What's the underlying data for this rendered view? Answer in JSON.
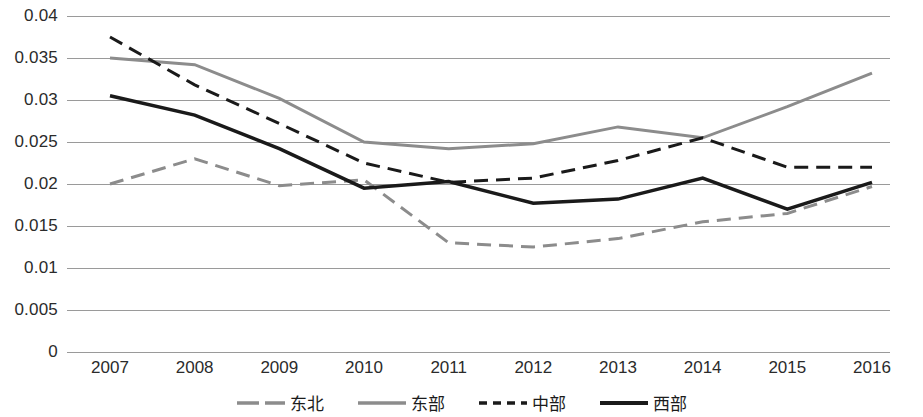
{
  "chart_data": {
    "type": "line",
    "title": "",
    "subtitle": "",
    "xlabel": "",
    "ylabel": "",
    "x": [
      "2007",
      "2008",
      "2009",
      "2010",
      "2011",
      "2012",
      "2013",
      "2014",
      "2015",
      "2016"
    ],
    "categories": [
      "2007",
      "2008",
      "2009",
      "2010",
      "2011",
      "2012",
      "2013",
      "2014",
      "2015",
      "2016"
    ],
    "ylim": [
      0,
      0.04
    ],
    "yticks": [
      "0",
      "0.005",
      "0.01",
      "0.015",
      "0.02",
      "0.025",
      "0.03",
      "0.035",
      "0.04"
    ],
    "ytick_values": [
      0,
      0.005,
      0.01,
      0.015,
      0.02,
      0.025,
      0.03,
      0.035,
      0.04
    ],
    "grid": true,
    "legend_position": "bottom",
    "series": [
      {
        "name": "东北",
        "color": "#8c8c8c",
        "style": "dashed",
        "width": 3,
        "values": [
          0.02,
          0.023,
          0.0198,
          0.0205,
          0.013,
          0.0125,
          0.0135,
          0.0155,
          0.0165,
          0.0197
        ]
      },
      {
        "name": "东部",
        "color": "#8c8c8c",
        "style": "solid",
        "width": 3,
        "values": [
          0.035,
          0.0342,
          0.0302,
          0.025,
          0.0242,
          0.0248,
          0.0268,
          0.0255,
          0.0292,
          0.0332
        ]
      },
      {
        "name": "中部",
        "color": "#1a1a1a",
        "style": "dashed",
        "width": 3,
        "values": [
          0.0375,
          0.0318,
          0.0272,
          0.0225,
          0.0202,
          0.0207,
          0.0228,
          0.0255,
          0.022,
          0.022
        ]
      },
      {
        "name": "西部",
        "color": "#1a1a1a",
        "style": "solid",
        "width": 3.5,
        "values": [
          0.0305,
          0.0282,
          0.0242,
          0.0195,
          0.0203,
          0.0177,
          0.0182,
          0.0207,
          0.017,
          0.0202
        ]
      }
    ]
  },
  "legend": {
    "items": [
      {
        "label": "东北"
      },
      {
        "label": "东部"
      },
      {
        "label": "中部"
      },
      {
        "label": "西部"
      }
    ]
  },
  "axes": {
    "y_labels": [
      "0.04",
      "0.035",
      "0.03",
      "0.025",
      "0.02",
      "0.015",
      "0.01",
      "0.005",
      "0"
    ],
    "x_labels": [
      "2007",
      "2008",
      "2009",
      "2010",
      "2011",
      "2012",
      "2013",
      "2014",
      "2015",
      "2016"
    ]
  }
}
